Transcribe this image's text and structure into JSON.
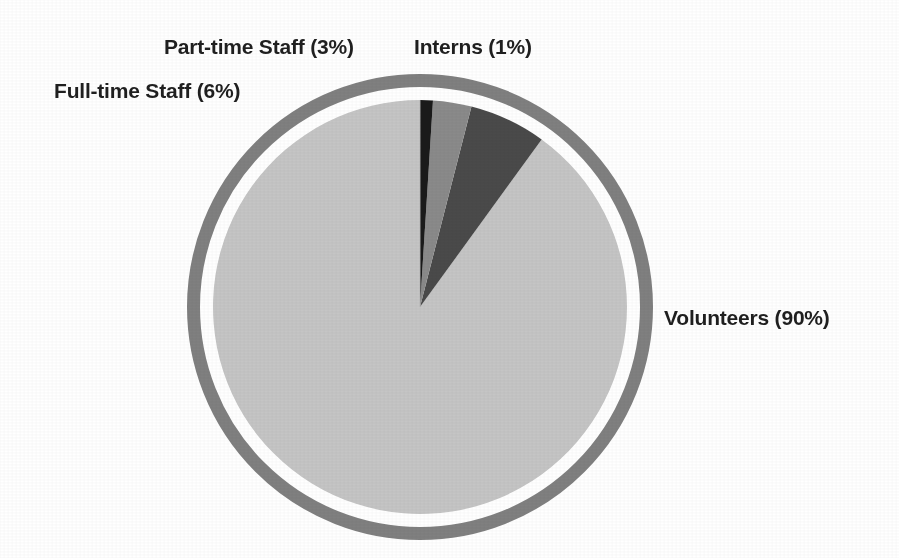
{
  "chart_data": {
    "type": "pie",
    "title": "",
    "subtitle": "",
    "xlabel": "",
    "ylabel": "",
    "grid": false,
    "legend_position": "none",
    "label_style": "callout labels placed outside the pie",
    "units": "percent",
    "total": 100,
    "categories": [
      "Volunteers",
      "Full-time Staff",
      "Part-time Staff",
      "Interns"
    ],
    "values": [
      90,
      6,
      3,
      1
    ],
    "slices": [
      {
        "name": "Volunteers",
        "value": 90,
        "label": "Volunteers (90%)",
        "color": "#c5c5c5",
        "start_angle_deg": 0,
        "end_angle_deg": 324
      },
      {
        "name": "Full-time Staff",
        "value": 6,
        "label": "Full-time Staff (6%)",
        "color": "#4a4a4a",
        "start_angle_deg": 324,
        "end_angle_deg": 345.6
      },
      {
        "name": "Part-time Staff",
        "value": 3,
        "label": "Part-time Staff (3%)",
        "color": "#8a8a8a",
        "start_angle_deg": 345.6,
        "end_angle_deg": 356.4
      },
      {
        "name": "Interns",
        "value": 1,
        "label": "Interns (1%)",
        "color": "#1a1a1a",
        "start_angle_deg": 356.4,
        "end_angle_deg": 360
      }
    ],
    "annotations": [
      "Part-time Staff (3%)",
      "Interns (1%)",
      "Full-time Staff (6%)",
      "Volunteers (90%)"
    ]
  },
  "labels": {
    "part_time": "Part-time Staff (3%)",
    "interns": "Interns (1%)",
    "full_time": "Full-time Staff (6%)",
    "volunteers": "Volunteers (90%)"
  },
  "colors": {
    "background": "#ffffff",
    "ring": "#808080",
    "ring_gap": "#ffffff",
    "volunteers": "#c5c5c5",
    "full_time_staff": "#4a4a4a",
    "part_time_staff": "#8a8a8a",
    "interns": "#1a1a1a",
    "label_text": "#1f1f1f"
  },
  "geometry": {
    "center_x": 420,
    "center_y": 307,
    "pie_radius": 207,
    "ring_inner_radius": 220,
    "ring_outer_radius": 233
  }
}
